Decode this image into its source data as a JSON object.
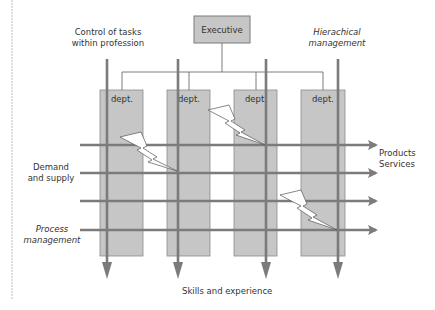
{
  "executive": {
    "label": "Executive"
  },
  "departments": [
    {
      "label": "dept."
    },
    {
      "label": "dept."
    },
    {
      "label": "dept."
    },
    {
      "label": "dept."
    }
  ],
  "labels": {
    "control_line1": "Control of tasks",
    "control_line2": "within profession",
    "hierarchical_line1": "Hierachical",
    "hierarchical_line2": "management",
    "demand_line1": "Demand",
    "demand_line2": "and supply",
    "process_line1": "Process",
    "process_line2": "management",
    "products": "Products",
    "services": "Services",
    "skills": "Skills and experience"
  },
  "colors": {
    "box_fill": "#c6c6c6",
    "box_stroke": "#8a8a8a",
    "arrow": "#7b7b7b",
    "connector": "#6e6e6e",
    "lightning_fill": "#ffffff",
    "lightning_stroke": "#555555"
  }
}
